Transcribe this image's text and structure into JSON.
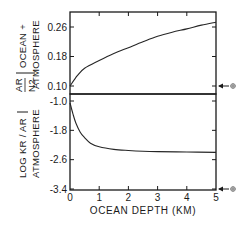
{
  "chart_data": [
    {
      "type": "line",
      "panel": "top",
      "ylabel_fraction": {
        "numerator": "AR",
        "denominator": "N2"
      },
      "ylabel_suffix_1": "OCEAN +",
      "ylabel_suffix_2": "ATMOSPHERE",
      "ylim": [
        0.1,
        0.26
      ],
      "yticks": [
        0.1,
        0.18,
        0.26
      ],
      "ytick_labels": [
        "0.10",
        "0.18",
        "0.26"
      ],
      "xlim": [
        0,
        5
      ],
      "series": [
        {
          "name": "Ar/N2 ocean + atmosphere",
          "x": [
            0,
            0.25,
            0.5,
            1,
            1.5,
            2,
            2.5,
            3,
            3.5,
            4,
            4.5,
            5
          ],
          "values": [
            0.1,
            0.128,
            0.148,
            0.169,
            0.188,
            0.204,
            0.22,
            0.235,
            0.246,
            0.255,
            0.265,
            0.273
          ]
        }
      ],
      "annotation": {
        "label": "⊕",
        "value": 0.1,
        "meaning": "present atmosphere value marker"
      }
    },
    {
      "type": "line",
      "panel": "bottom",
      "ylabel_line1": "LOG KR / AR",
      "ylabel_line2": "ATMOSPHERE",
      "ylim": [
        -3.4,
        -1.0
      ],
      "yticks": [
        -1.0,
        -1.8,
        -2.6,
        -3.4
      ],
      "ytick_labels": [
        "-1.0",
        "-1.8",
        "-2.6",
        "-3.4"
      ],
      "xlim": [
        0,
        5
      ],
      "series": [
        {
          "name": "log Kr/Ar atmosphere",
          "x": [
            0,
            0.1,
            0.2,
            0.35,
            0.5,
            0.7,
            1,
            1.5,
            2,
            2.5,
            3,
            4,
            5
          ],
          "values": [
            -1.05,
            -1.35,
            -1.6,
            -1.85,
            -2.0,
            -2.15,
            -2.25,
            -2.32,
            -2.35,
            -2.37,
            -2.38,
            -2.39,
            -2.4
          ]
        }
      ],
      "annotation": {
        "label": "⊕",
        "value": -3.4,
        "meaning": "present atmosphere value marker"
      }
    }
  ],
  "x_axis": {
    "label": "OCEAN DEPTH (KM)",
    "ticks": [
      0,
      1,
      2,
      3,
      4,
      5
    ],
    "tick_labels": [
      "0",
      "1",
      "2",
      "3",
      "4",
      "5"
    ]
  },
  "colors": {
    "ink": "#1a1a1a",
    "marker": "#777777"
  }
}
